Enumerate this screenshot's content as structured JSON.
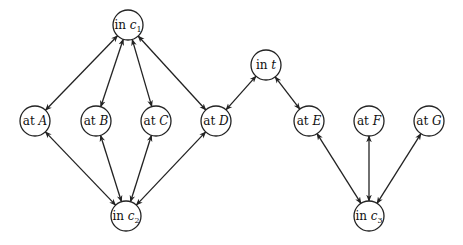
{
  "diagram": {
    "type": "state-graph",
    "colors": {
      "stroke": "#222222",
      "fill": "#ffffff",
      "text": "#111111"
    },
    "node_radius": 15,
    "nodes": [
      {
        "id": "c1",
        "prefix": "in",
        "var": "c",
        "sub": "1",
        "x": 128,
        "y": 25
      },
      {
        "id": "A",
        "prefix": "at",
        "var": "A",
        "sub": "",
        "x": 35,
        "y": 121
      },
      {
        "id": "B",
        "prefix": "at",
        "var": "B",
        "sub": "",
        "x": 96,
        "y": 121
      },
      {
        "id": "C",
        "prefix": "at",
        "var": "C",
        "sub": "",
        "x": 156,
        "y": 121
      },
      {
        "id": "D",
        "prefix": "at",
        "var": "D",
        "sub": "",
        "x": 216,
        "y": 121
      },
      {
        "id": "c2",
        "prefix": "in",
        "var": "c",
        "sub": "2",
        "x": 126,
        "y": 216
      },
      {
        "id": "t",
        "prefix": "in",
        "var": "t",
        "sub": "",
        "x": 266,
        "y": 65
      },
      {
        "id": "E",
        "prefix": "at",
        "var": "E",
        "sub": "",
        "x": 309,
        "y": 121
      },
      {
        "id": "F",
        "prefix": "at",
        "var": "F",
        "sub": "",
        "x": 369,
        "y": 121
      },
      {
        "id": "G",
        "prefix": "at",
        "var": "G",
        "sub": "",
        "x": 429,
        "y": 121
      },
      {
        "id": "c3",
        "prefix": "in",
        "var": "c",
        "sub": "3",
        "x": 369,
        "y": 216
      }
    ],
    "edges": [
      {
        "from": "c1",
        "to": "A",
        "bidirectional": true
      },
      {
        "from": "c1",
        "to": "B",
        "bidirectional": true
      },
      {
        "from": "c1",
        "to": "C",
        "bidirectional": true
      },
      {
        "from": "c1",
        "to": "D",
        "bidirectional": true
      },
      {
        "from": "c2",
        "to": "A",
        "bidirectional": true
      },
      {
        "from": "c2",
        "to": "B",
        "bidirectional": true
      },
      {
        "from": "c2",
        "to": "C",
        "bidirectional": true
      },
      {
        "from": "c2",
        "to": "D",
        "bidirectional": true
      },
      {
        "from": "t",
        "to": "D",
        "bidirectional": true
      },
      {
        "from": "t",
        "to": "E",
        "bidirectional": true
      },
      {
        "from": "c3",
        "to": "E",
        "bidirectional": true
      },
      {
        "from": "c3",
        "to": "F",
        "bidirectional": true
      },
      {
        "from": "c3",
        "to": "G",
        "bidirectional": true
      }
    ]
  }
}
